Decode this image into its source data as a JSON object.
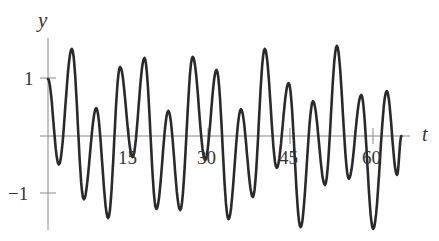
{
  "chart_data": {
    "type": "line",
    "title": "",
    "xlabel": "t",
    "ylabel": "y",
    "xlim": [
      0,
      68
    ],
    "ylim": [
      -1.75,
      1.75
    ],
    "x_ticks": [
      15,
      30,
      45,
      60
    ],
    "x_tick_labels": [
      "15",
      "30",
      "45",
      "60"
    ],
    "y_ticks": [
      1,
      -1
    ],
    "y_tick_labels": [
      "1",
      "−1"
    ],
    "grid": false,
    "legend": null,
    "series": [
      {
        "name": "y(t)",
        "color": "#2a2a2a",
        "points": [
          [
            0,
            1.0
          ],
          [
            2.0,
            -0.5
          ],
          [
            4.4,
            1.53
          ],
          [
            6.6,
            -1.11
          ],
          [
            8.9,
            0.49
          ],
          [
            11.1,
            -1.44
          ],
          [
            13.3,
            1.21
          ],
          [
            15.6,
            -0.37
          ],
          [
            17.8,
            1.37
          ],
          [
            20.0,
            -1.28
          ],
          [
            22.2,
            0.44
          ],
          [
            24.4,
            -1.3
          ],
          [
            26.7,
            1.39
          ],
          [
            29.0,
            -0.42
          ],
          [
            31.1,
            1.16
          ],
          [
            33.3,
            -1.46
          ],
          [
            35.6,
            0.47
          ],
          [
            37.8,
            -1.07
          ],
          [
            40.0,
            1.53
          ],
          [
            42.2,
            -0.56
          ],
          [
            44.4,
            0.93
          ],
          [
            46.6,
            -1.6
          ],
          [
            48.9,
            0.61
          ],
          [
            51.1,
            -0.86
          ],
          [
            53.3,
            1.58
          ],
          [
            55.5,
            -0.75
          ],
          [
            57.8,
            0.72
          ],
          [
            60.0,
            -1.63
          ],
          [
            62.5,
            0.79
          ],
          [
            64.4,
            -0.68
          ],
          [
            65.2,
            0.0
          ]
        ]
      }
    ]
  },
  "axes": {
    "y_label": "y",
    "x_label": "t",
    "y_tick_1": "1",
    "y_tick_neg1": "−1",
    "x_tick_15": "15",
    "x_tick_30": "30",
    "x_tick_45": "45",
    "x_tick_60": "60"
  }
}
